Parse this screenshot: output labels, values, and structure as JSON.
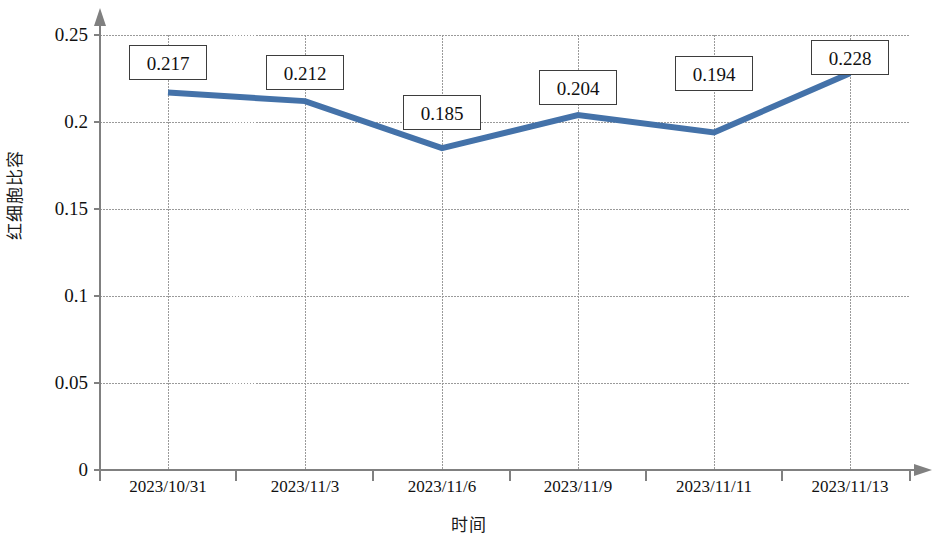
{
  "chart_data": {
    "type": "line",
    "title": "",
    "xlabel": "时间",
    "ylabel": "红细胞比容",
    "categories": [
      "2023/10/31",
      "2023/11/3",
      "2023/11/6",
      "2023/11/9",
      "2023/11/11",
      "2023/11/13"
    ],
    "values": [
      0.217,
      0.212,
      0.185,
      0.204,
      0.194,
      0.228
    ],
    "value_labels": [
      "0.217",
      "0.212",
      "0.185",
      "0.204",
      "0.194",
      "0.228"
    ],
    "series": [
      {
        "name": "红细胞比容",
        "values": [
          0.217,
          0.212,
          0.185,
          0.204,
          0.194,
          0.228
        ],
        "color": "#4472A9"
      }
    ],
    "ylim": [
      0,
      0.25
    ],
    "yticks": [
      0,
      0.05,
      0.1,
      0.15,
      0.2,
      0.25
    ],
    "ytick_labels": [
      "0",
      "0.05",
      "0.1",
      "0.15",
      "0.2",
      "0.25"
    ],
    "grid": "both",
    "legend": "none",
    "line_color": "#4472A9",
    "grid_color": "#9a9a9a",
    "axis_color": "#808080"
  },
  "axes": {
    "y_title": "红细胞比容",
    "x_title": "时间"
  }
}
